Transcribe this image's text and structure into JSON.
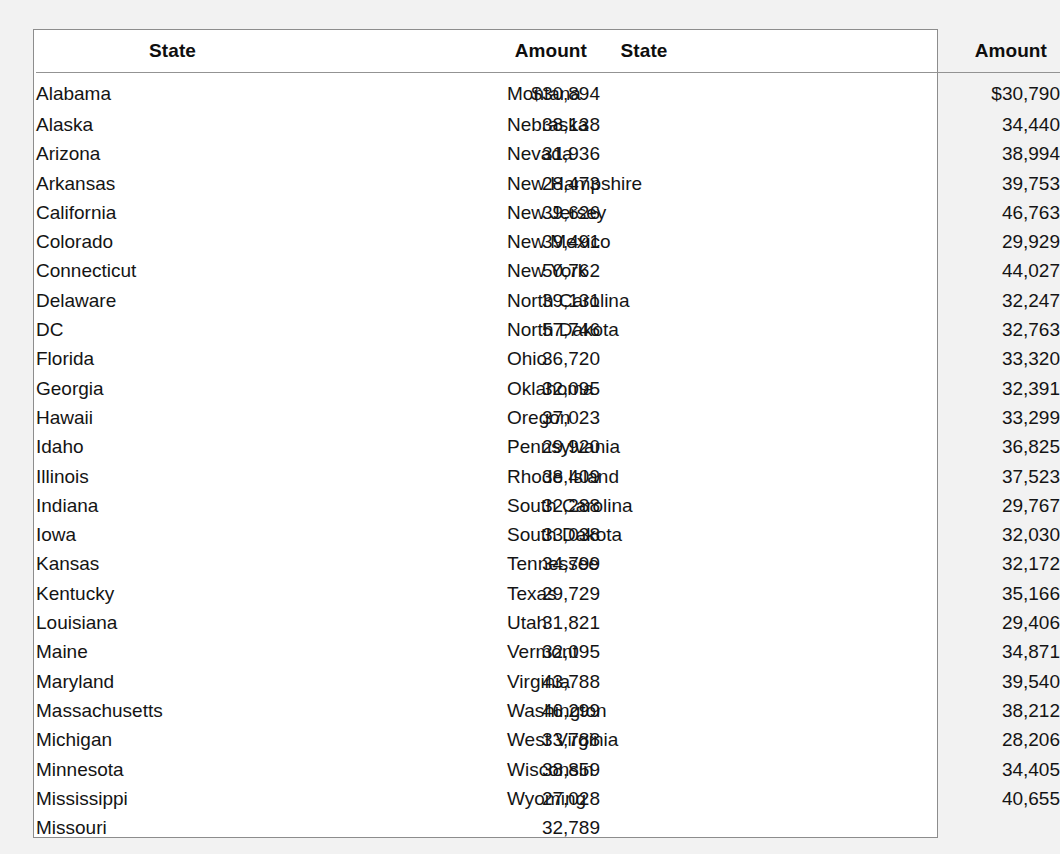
{
  "document": {
    "caption_remnant": "",
    "columns": [
      {
        "id": "left",
        "headers": {
          "state": "State",
          "amount": "Amount"
        },
        "rows": [
          {
            "state": "Alabama",
            "amount": "$30,894"
          },
          {
            "state": "Alaska",
            "amount": "38,138"
          },
          {
            "state": "Arizona",
            "amount": "31,936"
          },
          {
            "state": "Arkansas",
            "amount": "28,473"
          },
          {
            "state": "California",
            "amount": "39,626"
          },
          {
            "state": "Colorado",
            "amount": "39,491"
          },
          {
            "state": "Connecticut",
            "amount": "50,762"
          },
          {
            "state": "Delaware",
            "amount": "39,131"
          },
          {
            "state": "DC",
            "amount": "57,746"
          },
          {
            "state": "Florida",
            "amount": "36,720"
          },
          {
            "state": "Georgia",
            "amount": "32,095"
          },
          {
            "state": "Hawaii",
            "amount": "37,023"
          },
          {
            "state": "Idaho",
            "amount": "29,920"
          },
          {
            "state": "Illinois",
            "amount": "38,409"
          },
          {
            "state": "Indiana",
            "amount": "32,288"
          },
          {
            "state": "Iowa",
            "amount": "33,038"
          },
          {
            "state": "Kansas",
            "amount": "34,799"
          },
          {
            "state": "Kentucky",
            "amount": "29,729"
          },
          {
            "state": "Louisiana",
            "amount": "31,821"
          },
          {
            "state": "Maine",
            "amount": "32,095"
          },
          {
            "state": "Maryland",
            "amount": "43,788"
          },
          {
            "state": "Massachusetts",
            "amount": "46,299"
          },
          {
            "state": "Michigan",
            "amount": "33,788"
          },
          {
            "state": "Minnesota",
            "amount": "38,859"
          },
          {
            "state": "Mississippi",
            "amount": "27,028"
          },
          {
            "state": "Missouri",
            "amount": "32,789"
          }
        ]
      },
      {
        "id": "right",
        "headers": {
          "state": "State",
          "amount": "Amount"
        },
        "rows": [
          {
            "state": "Montana",
            "amount": "$30,790"
          },
          {
            "state": "Nebraska",
            "amount": "34,440"
          },
          {
            "state": "Nevada",
            "amount": "38,994"
          },
          {
            "state": "New Hampshire",
            "amount": "39,753"
          },
          {
            "state": "New Jersey",
            "amount": "46,763"
          },
          {
            "state": "New Mexico",
            "amount": "29,929"
          },
          {
            "state": "New York",
            "amount": "44,027"
          },
          {
            "state": "North Carolina",
            "amount": "32,247"
          },
          {
            "state": "North Dakota",
            "amount": "32,763"
          },
          {
            "state": "Ohio",
            "amount": "33,320"
          },
          {
            "state": "Oklahoma",
            "amount": "32,391"
          },
          {
            "state": "Oregon",
            "amount": "33,299"
          },
          {
            "state": "Pennsylvania",
            "amount": "36,825"
          },
          {
            "state": "Rhode Island",
            "amount": "37,523"
          },
          {
            "state": "South Carolina",
            "amount": "29,767"
          },
          {
            "state": "South Dakota",
            "amount": "32,030"
          },
          {
            "state": "Tennessee",
            "amount": "32,172"
          },
          {
            "state": "Texas",
            "amount": "35,166"
          },
          {
            "state": "Utah",
            "amount": "29,406"
          },
          {
            "state": "Vermont",
            "amount": "34,871"
          },
          {
            "state": "Virginia",
            "amount": "39,540"
          },
          {
            "state": "Washington",
            "amount": "38,212"
          },
          {
            "state": "West Virginia",
            "amount": "28,206"
          },
          {
            "state": "Wisconsin",
            "amount": "34,405"
          },
          {
            "state": "Wyoming",
            "amount": "40,655"
          }
        ]
      }
    ]
  },
  "colors": {
    "page_background": "#f2f2f2",
    "panel_background": "#ffffff",
    "panel_border": "#8d8d8d",
    "header_rule": "#939393",
    "text": "#141414",
    "header_text": "#0e0e0e"
  }
}
